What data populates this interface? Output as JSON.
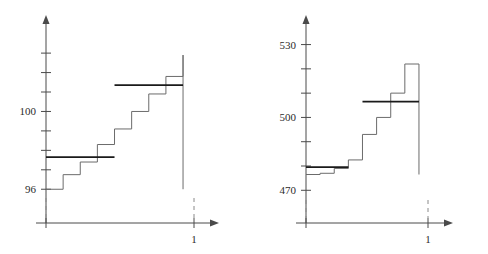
{
  "figure": {
    "title": "",
    "panel_count": 2
  },
  "chart_data": [
    {
      "id": "left-panel",
      "type": "line",
      "subtype": "step-function",
      "title": "",
      "xlabel": "",
      "ylabel": "",
      "grid": false,
      "legend": false,
      "xlim": [
        0,
        1.08
      ],
      "ylim": [
        95.55,
        104.6
      ],
      "yticks": [
        96,
        97,
        98,
        99,
        100,
        101,
        102,
        103
      ],
      "ytick_labels_visible": [
        "96",
        "100"
      ],
      "ytick_label_values": [
        96,
        100
      ],
      "xticks": [
        0,
        1
      ],
      "xtick_labels_visible": [
        "1"
      ],
      "xtick_label_values": [
        1
      ],
      "series": [
        {
          "name": "empirical-step",
          "style": "thin-gray-staircase",
          "color": "#6b6b6b",
          "x_edges": [
            0.0,
            0.125,
            0.25,
            0.375,
            0.5,
            0.625,
            0.75,
            0.875,
            1.0
          ],
          "values": [
            96.0,
            96.75,
            97.4,
            98.3,
            99.1,
            100.0,
            100.9,
            101.8,
            102.9
          ]
        }
      ],
      "reference_lines": [
        {
          "name": "lower-reference-level",
          "style": "bold-horizontal",
          "color": "#1a1a1a",
          "y": 97.65,
          "x_start": 0.0,
          "x_end": 0.5
        },
        {
          "name": "upper-reference-level",
          "style": "bold-horizontal",
          "color": "#1a1a1a",
          "y": 101.35,
          "x_start": 0.5,
          "x_end": 1.0
        }
      ]
    },
    {
      "id": "right-panel",
      "type": "line",
      "subtype": "step-function",
      "title": "",
      "xlabel": "",
      "ylabel": "",
      "grid": false,
      "legend": false,
      "xlim": [
        0,
        1.08
      ],
      "ylim": [
        466,
        536
      ],
      "yticks": [
        470,
        480,
        490,
        500,
        510,
        520,
        530
      ],
      "ytick_labels_visible": [
        "470",
        "500",
        "530"
      ],
      "ytick_label_values": [
        470,
        500,
        530
      ],
      "xticks": [
        0,
        1
      ],
      "xtick_labels_visible": [
        "1"
      ],
      "xtick_label_values": [
        1
      ],
      "series": [
        {
          "name": "empirical-step",
          "style": "thin-gray-staircase",
          "color": "#6b6b6b",
          "x_edges": [
            0.0,
            0.125,
            0.25,
            0.375,
            0.5,
            0.625,
            0.75,
            0.875,
            1.0
          ],
          "values": [
            476.5,
            477.0,
            479.0,
            482.5,
            493.0,
            500.0,
            510.0,
            522.0,
            522.0
          ]
        }
      ],
      "reference_lines": [
        {
          "name": "lower-reference-level",
          "style": "bold-horizontal",
          "color": "#1a1a1a",
          "y": 479.5,
          "x_start": 0.0,
          "x_end": 0.375
        },
        {
          "name": "upper-reference-level",
          "style": "bold-horizontal",
          "color": "#1a1a1a",
          "y": 506.5,
          "x_start": 0.5,
          "x_end": 1.0
        }
      ]
    }
  ],
  "colors": {
    "axis": "#4a4a4a",
    "step": "#6b6b6b",
    "reference": "#1a1a1a",
    "dashed": "#8a8a8a",
    "text": "#2b2b2b",
    "background": "#ffffff"
  }
}
